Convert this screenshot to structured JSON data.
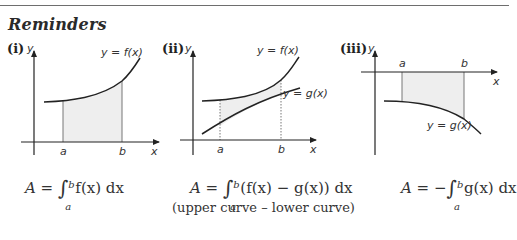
{
  "header": {
    "title": "Reminders"
  },
  "figures": [
    {
      "label": "(i)",
      "y_axis": "y",
      "x_axis": "x",
      "curve_label": "y = f(x)",
      "limits": {
        "a": "a",
        "b": "b"
      },
      "formula": {
        "lhs": "A = ",
        "upper": "b",
        "lower": "a",
        "integrand": "f(x) dx"
      }
    },
    {
      "label": "(ii)",
      "y_axis": "y",
      "x_axis": "x",
      "upper_curve_label": "y = f(x)",
      "lower_curve_label": "y = g(x)",
      "limits": {
        "a": "a",
        "b": "b"
      },
      "formula": {
        "lhs": "A = ",
        "upper": "b",
        "lower": "a",
        "integrand": "(f(x) − g(x)) dx"
      },
      "note": "(upper curve – lower curve)"
    },
    {
      "label": "(iii)",
      "y_axis": "y",
      "x_axis": "x",
      "curve_label": "y = g(x)",
      "limits": {
        "a": "a",
        "b": "b"
      },
      "formula": {
        "lhs": "A = −",
        "upper": "b",
        "lower": "a",
        "integrand": "g(x) dx"
      }
    }
  ],
  "colors": {
    "shade": "#eeeeee",
    "curve": "#222222",
    "axis": "#222222",
    "rule": "#6e6e6e"
  }
}
